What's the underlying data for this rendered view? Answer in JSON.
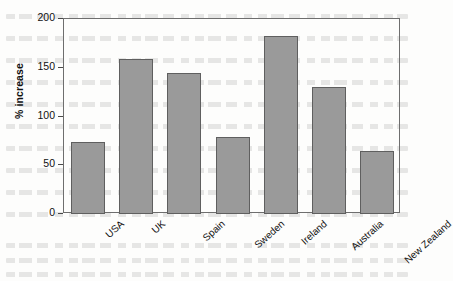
{
  "chart_data": {
    "type": "bar",
    "title": "",
    "subtitle": "",
    "xlabel": "",
    "ylabel": "% increase",
    "categories": [
      "USA",
      "UK",
      "Spain",
      "Sweden",
      "Ireland",
      "Australia",
      "New Zealand"
    ],
    "values": [
      74,
      159,
      145,
      79,
      183,
      130,
      65
    ],
    "ylim": [
      0,
      200
    ],
    "yticks": [
      0,
      50,
      100,
      150,
      200
    ],
    "ytick_labels": [
      "0",
      "50",
      "100",
      "150",
      "200"
    ],
    "grid": false,
    "legend": null,
    "bar_color": "#9a9a9a",
    "bar_border_color": "#5f5f5f",
    "axis_color": "#6e6e6e",
    "background_color": "#fdfdfc"
  }
}
